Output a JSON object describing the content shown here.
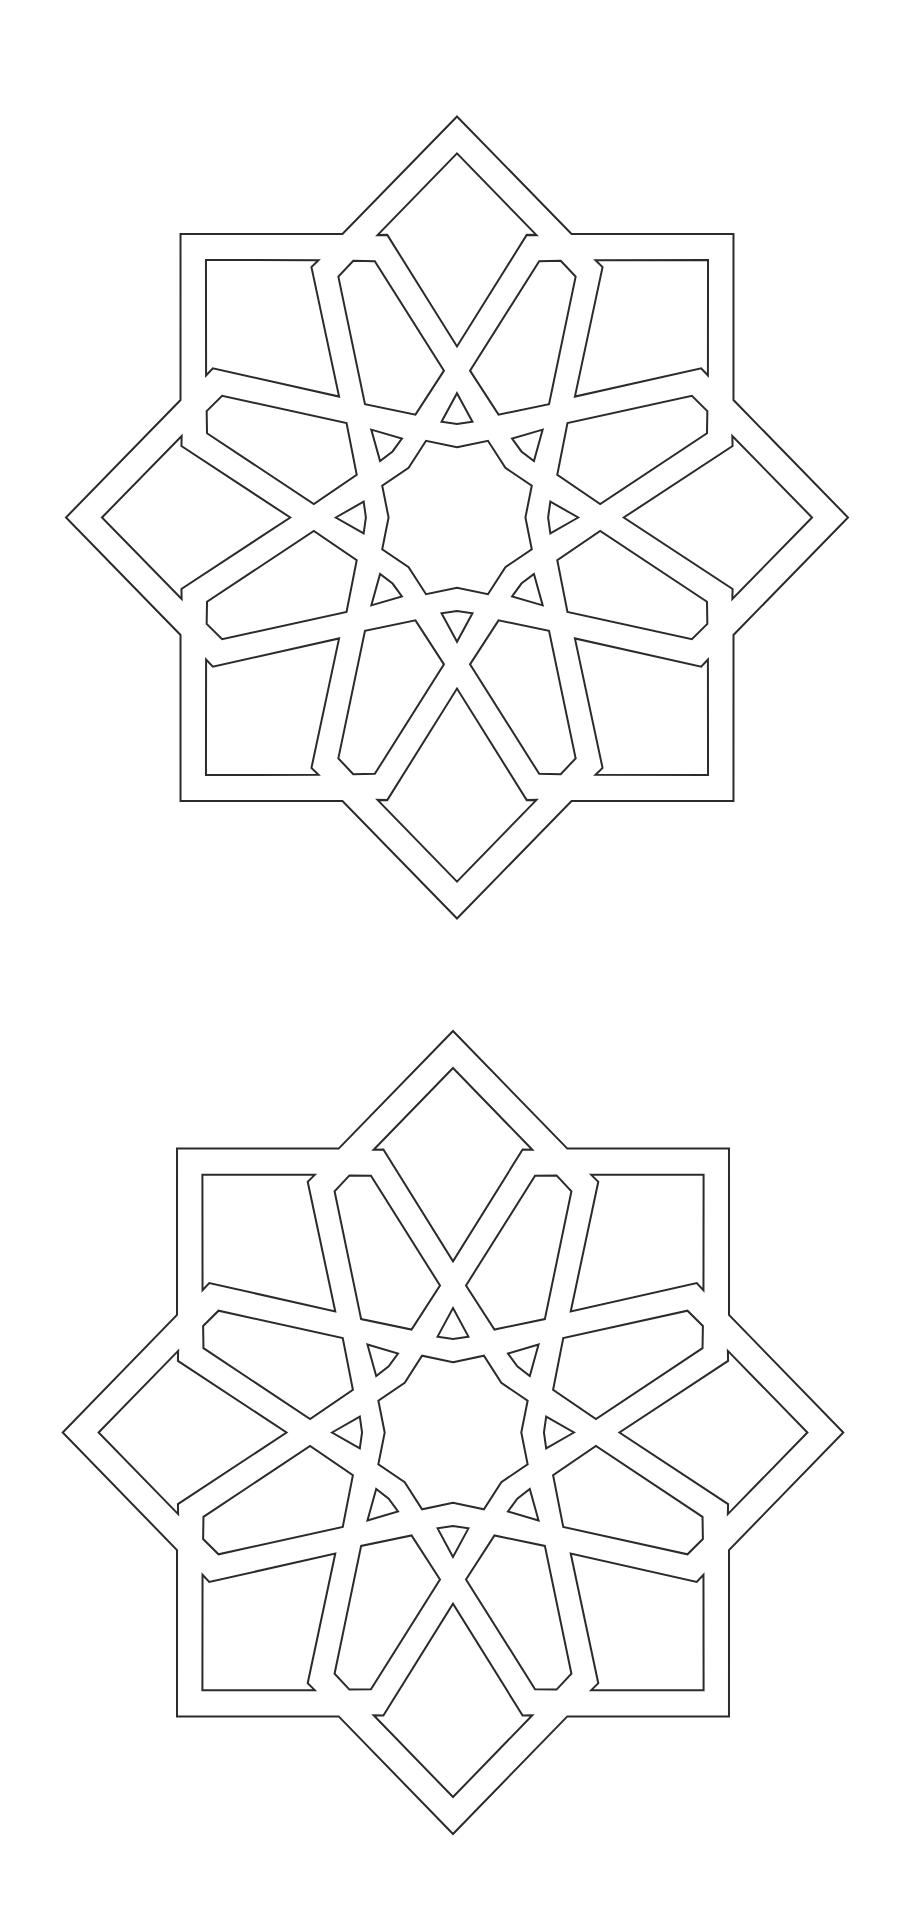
{
  "canvas": {
    "width": 914,
    "height": 1915,
    "background": "#ffffff"
  },
  "style": {
    "stroke": "#2b2b2b",
    "stroke_width": 2
  },
  "stars": [
    {
      "id": "star-top",
      "cx": 457.0,
      "cy": 517.5,
      "rx": 391.0,
      "ry": 401.0
    },
    {
      "id": "star-bottom",
      "cx": 453.0,
      "cy": 1432.5,
      "rx": 390.3,
      "ry": 401.5
    }
  ],
  "pattern": {
    "description": "Eight-point star with interlaced 16-fold strapwork rosette",
    "symmetry": 8,
    "base_angle_deg": 270,
    "outer_star": {
      "name": "outer-star-outline",
      "point_radius": 1.0,
      "reflex_radius": 0.7654
    },
    "center_rosette": {
      "name": "center-rosette",
      "axis_radius": 0.175,
      "between_radius": 0.207
    },
    "repeated_cells": [
      {
        "name": "point-cell",
        "offset_deg": 0,
        "vertices": [
          [
            0.908,
            0
          ],
          [
            0.733,
            16.1
          ],
          [
            0.727,
            14.2
          ],
          [
            0.4265,
            0
          ],
          [
            0.727,
            -14.2
          ],
          [
            0.733,
            -16.1
          ]
        ]
      },
      {
        "name": "small-triangle-cell",
        "offset_deg": 0,
        "vertices": [
          [
            0.31,
            0
          ],
          [
            0.242,
            9.4
          ],
          [
            0.233,
            0
          ],
          [
            0.242,
            -9.4
          ]
        ]
      },
      {
        "name": "hexagon-cell",
        "offset_deg": 22.5,
        "vertices": [
          [
            0.693,
            0
          ],
          [
            0.673,
            4.3
          ],
          [
            0.3677,
            17.3
          ],
          [
            0.2776,
            0
          ],
          [
            0.3677,
            -17.3
          ],
          [
            0.673,
            -4.3
          ]
        ]
      }
    ]
  }
}
